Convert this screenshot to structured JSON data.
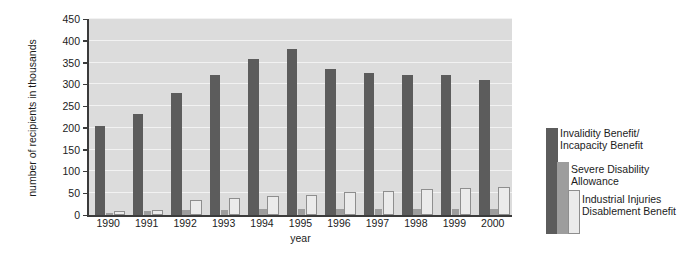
{
  "chart_data": {
    "type": "bar",
    "title": "",
    "subtitle": "",
    "xlabel": "year",
    "ylabel": "number of recipients in thousands",
    "categories": [
      "1990",
      "1991",
      "1992",
      "1993",
      "1994",
      "1995",
      "1996",
      "1997",
      "1998",
      "1999",
      "2000"
    ],
    "ylim": [
      0,
      450
    ],
    "yticks": [
      0,
      50,
      100,
      150,
      200,
      250,
      300,
      350,
      400,
      450
    ],
    "ytick_labels": [
      "0",
      "50",
      "100",
      "150",
      "200",
      "250",
      "300",
      "350",
      "400",
      "450"
    ],
    "grid": true,
    "grid_axis": "y",
    "legend_position": "right",
    "orientation": "vertical",
    "series": [
      {
        "name": "Invalidity Benefit/\nIncapacity Benefit",
        "name_line1": "Invalidity Benefit/",
        "name_line2": "Incapacity Benefit",
        "color": "#5c5c5c",
        "values": [
          205,
          232,
          281,
          322,
          358,
          382,
          335,
          327,
          322,
          321,
          311
        ]
      },
      {
        "name": "Severe Disability\nAllowance",
        "name_line1": "Severe Disability",
        "name_line2": "Allowance",
        "color": "#9d9d9d",
        "values": [
          4,
          9,
          12,
          12,
          13,
          13,
          13,
          13,
          13,
          13,
          13
        ]
      },
      {
        "name": "Industrial Injuries\nDisablement Benefit",
        "name_line1": "Industrial Injuries",
        "name_line2": "Disablement Benefit",
        "color": "#ebebeb",
        "values": [
          10,
          12,
          35,
          40,
          44,
          46,
          52,
          56,
          60,
          62,
          65
        ]
      }
    ]
  },
  "axes": {
    "y_title": "number of recipients in thousands",
    "x_title": "year"
  },
  "colors": {
    "plot_background": "#dcdcdc",
    "gridline": "#f2f2f2",
    "axis": "#3b3b3b",
    "text": "#1c1c1c",
    "page_background": "#ffffff",
    "series_1": "#5c5c5c",
    "series_2": "#9d9d9d",
    "series_3": "#ebebeb",
    "series_3_border": "#8e8e8e"
  },
  "legend": {
    "entries": [
      {
        "line1": "Invalidity Benefit/",
        "line2": "Incapacity Benefit"
      },
      {
        "line1": "Severe Disability",
        "line2": "Allowance"
      },
      {
        "line1": "Industrial Injuries",
        "line2": "Disablement Benefit"
      }
    ]
  }
}
